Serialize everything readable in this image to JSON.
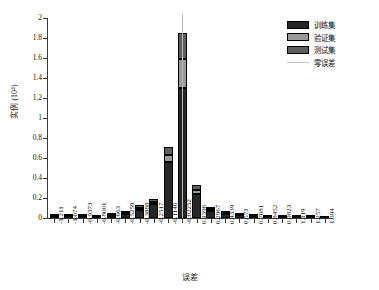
{
  "chart_data": {
    "type": "bar",
    "title": "",
    "subtitle": "",
    "xlabel": "误差",
    "ylabel": "实例 (10⁴)",
    "grid": false,
    "legend_position": "top-right",
    "stacked": true,
    "ylim": [
      0,
      2
    ],
    "yticks": [
      "0",
      "0.2",
      "0.4",
      "0.6",
      "0.8",
      "1",
      "1.2",
      "1.4",
      "1.6",
      "1.8",
      "2"
    ],
    "ytick_values": [
      0,
      0.2,
      0.4,
      0.6,
      0.8,
      1.0,
      1.2,
      1.4,
      1.6,
      1.8,
      2.0
    ],
    "categories": [
      "-1.211",
      "-1.074",
      "-0.9373",
      "-0.8001",
      "-0.663",
      "-0.5259",
      "-0.3888",
      "-0.2517",
      "-0.1146",
      "-0.02252",
      "0.1596",
      "0.2967",
      "0.4339",
      "0.571",
      "0.7081",
      "0.8452",
      "0.9823",
      "1.119",
      "1.257",
      "1.394"
    ],
    "series": [
      {
        "name": "训练集",
        "color": "#262626",
        "values": [
          0.012,
          0.013,
          0.014,
          0.009,
          0.021,
          0.043,
          0.085,
          0.14,
          0.56,
          1.3,
          0.245,
          0.075,
          0.04,
          0.026,
          0.013,
          0.009,
          0.008,
          0.006,
          0.005,
          0.004
        ]
      },
      {
        "name": "验证集",
        "color": "#9a9a9a",
        "values": [
          0.004,
          0.004,
          0.004,
          0.003,
          0.006,
          0.011,
          0.02,
          0.022,
          0.075,
          0.29,
          0.04,
          0.012,
          0.008,
          0.005,
          0.003,
          0.002,
          0.002,
          0.002,
          0.001,
          0.001
        ]
      },
      {
        "name": "测试集",
        "color": "#5e5e5e",
        "values": [
          0.005,
          0.004,
          0.005,
          0.004,
          0.007,
          0.012,
          0.022,
          0.024,
          0.078,
          0.265,
          0.045,
          0.014,
          0.009,
          0.006,
          0.004,
          0.003,
          0.002,
          0.002,
          0.002,
          0.001
        ]
      }
    ],
    "annotations": [
      {
        "name": "zero-error-line",
        "label": "零误差",
        "x_category": "-0.02252",
        "color": "#c2c2c2"
      }
    ]
  },
  "legend": {
    "items": [
      {
        "label": "训练集",
        "swatch": "train"
      },
      {
        "label": "验证集",
        "swatch": "valid"
      },
      {
        "label": "测试集",
        "swatch": "test"
      },
      {
        "label": "零误差",
        "swatch": "line"
      }
    ]
  }
}
